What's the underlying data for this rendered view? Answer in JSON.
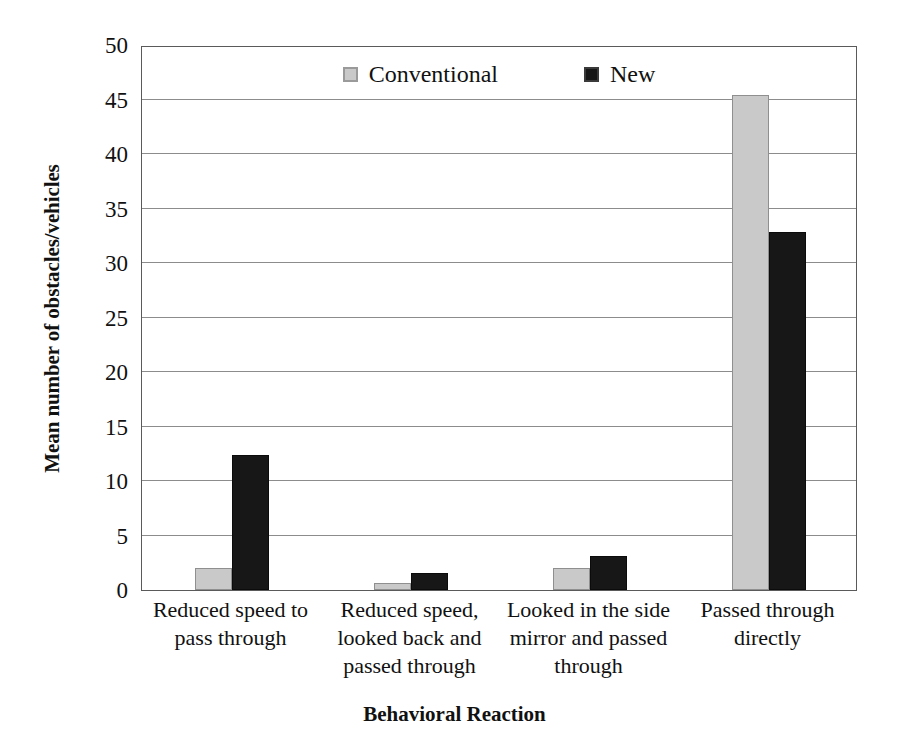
{
  "chart_data": {
    "type": "bar",
    "title": "",
    "xlabel": "Behavioral Reaction",
    "ylabel": "Mean number of obstacles/vehicles",
    "ylim": [
      0,
      50
    ],
    "yticks": [
      0,
      5,
      10,
      15,
      20,
      25,
      30,
      35,
      40,
      45,
      50
    ],
    "grid": true,
    "legend_position": "top-center",
    "categories": [
      "Reduced speed to pass through",
      "Reduced speed, looked back and passed through",
      "Looked in the side mirror and passed through",
      "Passed through directly"
    ],
    "series": [
      {
        "name": "Conventional",
        "color": "#c9c9c9",
        "values": [
          2.0,
          0.6,
          2.0,
          45.4
        ]
      },
      {
        "name": "New",
        "color": "#171717",
        "values": [
          12.4,
          1.6,
          3.1,
          32.8
        ]
      }
    ]
  },
  "axes": {
    "y_title": "Mean number of obstacles/vehicles",
    "x_title": "Behavioral Reaction",
    "y_tick_labels": [
      "50",
      "45",
      "40",
      "35",
      "30",
      "25",
      "20",
      "15",
      "10",
      "5",
      "0"
    ]
  },
  "legend": {
    "items": [
      {
        "label": "Conventional",
        "swatch": "gray-square-icon"
      },
      {
        "label": "New",
        "swatch": "black-square-icon"
      }
    ]
  },
  "category_labels": [
    "Reduced speed to pass through",
    "Reduced speed, looked back and passed through",
    "Looked in the side mirror and passed through",
    "Passed through directly"
  ]
}
